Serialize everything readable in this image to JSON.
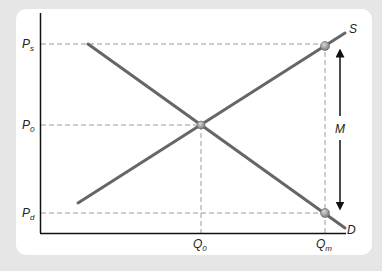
{
  "diagram": {
    "type": "supply-demand",
    "colors": {
      "background": "#e6e6e6",
      "panel": "#ffffff",
      "axis": "#111111",
      "curve": "#666666",
      "guide": "#999999",
      "point": "#8a8a8a",
      "arrow": "#111111"
    },
    "y_labels": [
      {
        "main": "P",
        "sub": "s"
      },
      {
        "main": "P",
        "sub": "0"
      },
      {
        "main": "P",
        "sub": "d"
      }
    ],
    "x_labels": [
      {
        "main": "Q",
        "sub": "0"
      },
      {
        "main": "Q",
        "sub": "m"
      }
    ],
    "curves": {
      "supply": "S",
      "demand": "D"
    },
    "arrow_label": "M"
  }
}
